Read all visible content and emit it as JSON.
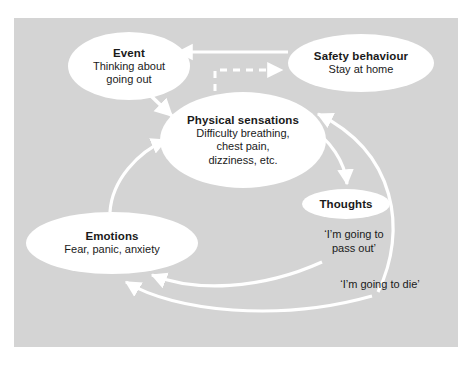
{
  "diagram": {
    "panel_color": "#d4d4d4",
    "arrow_color": "#ffffff",
    "text_color": "#1a1a1a",
    "nodes": [
      {
        "id": "event",
        "title": "Event",
        "body": "Thinking about\ngoing out",
        "body_lines": [
          "Thinking about",
          "going out"
        ]
      },
      {
        "id": "safety_behaviour",
        "title": "Safety behaviour",
        "body": "Stay at home",
        "body_lines": [
          "Stay at home"
        ]
      },
      {
        "id": "physical_sensations",
        "title": "Physical sensations",
        "body": "Difficulty breathing, chest pain, dizziness, etc.",
        "body_lines": [
          "Difficulty breathing,",
          "chest pain,",
          "dizziness, etc."
        ]
      },
      {
        "id": "thoughts",
        "title": "Thoughts",
        "body": "",
        "body_lines": []
      },
      {
        "id": "emotions",
        "title": "Emotions",
        "body": "Fear, panic, anxiety",
        "body_lines": [
          "Fear, panic, anxiety"
        ]
      }
    ],
    "floating_texts": [
      {
        "id": "thought_pass_out",
        "lines": [
          "‘I’m going to",
          "pass out’"
        ]
      },
      {
        "id": "thought_die",
        "lines": [
          "‘I’m going to die’"
        ]
      }
    ],
    "connections": [
      {
        "from": "safety_behaviour",
        "to": "event",
        "style": "solid"
      },
      {
        "from": "physical_sensations",
        "to": "safety_behaviour",
        "style": "dashed"
      },
      {
        "from": "event",
        "to": "physical_sensations",
        "style": "solid"
      },
      {
        "from": "physical_sensations",
        "to": "thoughts",
        "style": "solid"
      },
      {
        "from": "thoughts",
        "to": "emotions",
        "style": "solid"
      },
      {
        "from": "thought_die",
        "to": "emotions",
        "style": "solid"
      },
      {
        "from": "thought_die",
        "to": "physical_sensations",
        "style": "solid"
      },
      {
        "from": "emotions",
        "to": "physical_sensations",
        "style": "solid"
      }
    ]
  }
}
